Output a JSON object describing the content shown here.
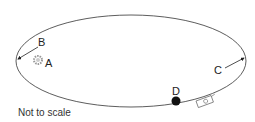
{
  "diagram": {
    "type": "orbit",
    "labels": {
      "A": "A",
      "B": "B",
      "C": "C",
      "D": "D"
    },
    "note": "Not to scale",
    "colors": {
      "orbit": "#333333",
      "star": "#999999",
      "planet": "#111111",
      "text": "#222222"
    }
  }
}
